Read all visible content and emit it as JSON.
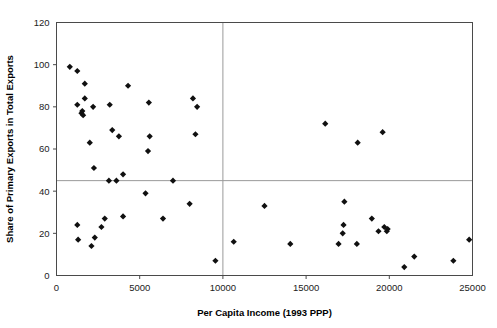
{
  "chart_data": {
    "type": "scatter",
    "title": "",
    "xlabel": "Per Capita Income (1993 PPP)",
    "ylabel": "Share of Primary Exports in Total Exports",
    "xlim": [
      0,
      25000
    ],
    "ylim": [
      0,
      120
    ],
    "xticks": [
      0,
      5000,
      10000,
      15000,
      20000,
      25000
    ],
    "xtick_labels": [
      "0",
      "5000",
      "10000",
      "15000",
      "20000",
      "25000"
    ],
    "yticks": [
      0,
      20,
      40,
      60,
      80,
      100,
      120
    ],
    "ytick_labels": [
      "0",
      "20",
      "40",
      "60",
      "80",
      "100",
      "120"
    ],
    "grid": false,
    "legend": null,
    "marker": "diamond",
    "marker_color": "#101010",
    "reference_lines": [
      {
        "orientation": "horizontal",
        "value": 45,
        "color": "#9a9a9a"
      },
      {
        "orientation": "vertical",
        "value": 10000,
        "color": "#9a9a9a"
      }
    ],
    "points": [
      {
        "x": 800,
        "y": 99
      },
      {
        "x": 1250,
        "y": 97
      },
      {
        "x": 1700,
        "y": 91
      },
      {
        "x": 1700,
        "y": 84
      },
      {
        "x": 1250,
        "y": 81
      },
      {
        "x": 2200,
        "y": 80
      },
      {
        "x": 1550,
        "y": 78
      },
      {
        "x": 1500,
        "y": 77
      },
      {
        "x": 1600,
        "y": 76
      },
      {
        "x": 3200,
        "y": 81
      },
      {
        "x": 4300,
        "y": 90
      },
      {
        "x": 5550,
        "y": 82
      },
      {
        "x": 8200,
        "y": 84
      },
      {
        "x": 8450,
        "y": 80
      },
      {
        "x": 3350,
        "y": 69
      },
      {
        "x": 3750,
        "y": 66
      },
      {
        "x": 5600,
        "y": 66
      },
      {
        "x": 8350,
        "y": 67
      },
      {
        "x": 5500,
        "y": 59
      },
      {
        "x": 2000,
        "y": 63
      },
      {
        "x": 2250,
        "y": 51
      },
      {
        "x": 4000,
        "y": 48
      },
      {
        "x": 3150,
        "y": 45
      },
      {
        "x": 3600,
        "y": 45
      },
      {
        "x": 7000,
        "y": 45
      },
      {
        "x": 5350,
        "y": 39
      },
      {
        "x": 8000,
        "y": 34
      },
      {
        "x": 12500,
        "y": 33
      },
      {
        "x": 2900,
        "y": 27
      },
      {
        "x": 4000,
        "y": 28
      },
      {
        "x": 6400,
        "y": 27
      },
      {
        "x": 1250,
        "y": 24
      },
      {
        "x": 2700,
        "y": 23
      },
      {
        "x": 1300,
        "y": 17
      },
      {
        "x": 2300,
        "y": 18
      },
      {
        "x": 2100,
        "y": 14
      },
      {
        "x": 9550,
        "y": 7
      },
      {
        "x": 10650,
        "y": 16
      },
      {
        "x": 14050,
        "y": 15
      },
      {
        "x": 16150,
        "y": 72
      },
      {
        "x": 18100,
        "y": 63
      },
      {
        "x": 19600,
        "y": 68
      },
      {
        "x": 17300,
        "y": 35
      },
      {
        "x": 19350,
        "y": 21
      },
      {
        "x": 19900,
        "y": 22
      },
      {
        "x": 17250,
        "y": 24
      },
      {
        "x": 17200,
        "y": 20
      },
      {
        "x": 18950,
        "y": 27
      },
      {
        "x": 19700,
        "y": 23
      },
      {
        "x": 19850,
        "y": 21
      },
      {
        "x": 16950,
        "y": 15
      },
      {
        "x": 18050,
        "y": 15
      },
      {
        "x": 20900,
        "y": 4
      },
      {
        "x": 21500,
        "y": 9
      },
      {
        "x": 23850,
        "y": 7
      },
      {
        "x": 24800,
        "y": 17
      }
    ]
  }
}
